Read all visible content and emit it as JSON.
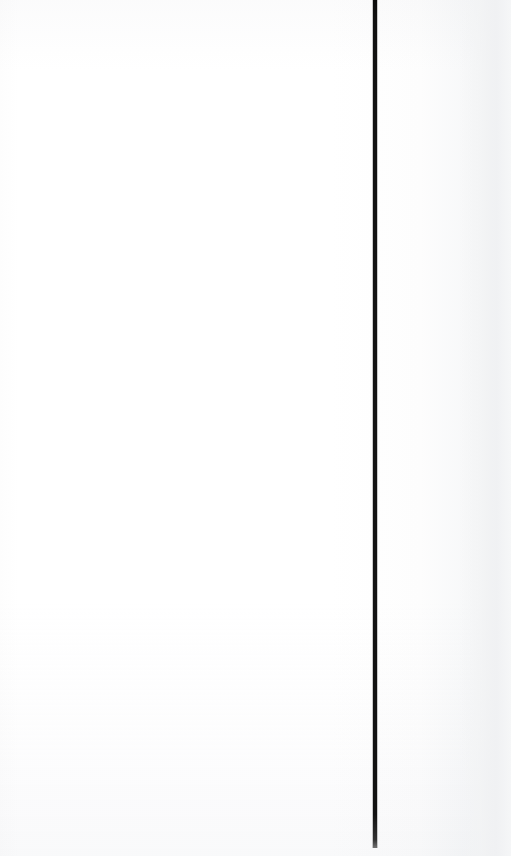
{
  "page": {
    "width": 511,
    "height": 856,
    "background_color": "#ffffff",
    "kind": "scanned-book-page",
    "content_area_text": "",
    "edge_shade_color": "#f2f3f4"
  },
  "divider": {
    "name": "vertical-rule",
    "color": "#121212",
    "thickness_px": 4,
    "x_px": 373,
    "top_px": 0,
    "height_px": 848
  },
  "section": {
    "label": "Meat",
    "script_style": "calligraphic-italic",
    "rotation_deg": -90,
    "color": "#0d0d0d",
    "x_px": 398,
    "y_px": 85,
    "width_px": 58,
    "height_px": 142
  }
}
